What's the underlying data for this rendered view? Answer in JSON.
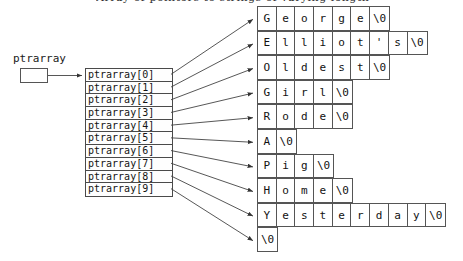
{
  "caption": {
    "text": "Array of pointers to strings of varying length"
  },
  "pointer_variable": {
    "label": "ptrarray",
    "box_value": ""
  },
  "array": {
    "name": "ptrarray",
    "cells": [
      {
        "label": "ptrarray[0]"
      },
      {
        "label": "ptrarray[1]"
      },
      {
        "label": "ptrarray[2]"
      },
      {
        "label": "ptrarray[3]"
      },
      {
        "label": "ptrarray[4]"
      },
      {
        "label": "ptrarray[5]"
      },
      {
        "label": "ptrarray[6]"
      },
      {
        "label": "ptrarray[7]"
      },
      {
        "label": "ptrarray[8]"
      },
      {
        "label": "ptrarray[9]"
      }
    ]
  },
  "strings": [
    {
      "index": 0,
      "text": "George",
      "chars": [
        "G",
        "e",
        "o",
        "r",
        "g",
        "e",
        "\\0"
      ]
    },
    {
      "index": 1,
      "text": "Elliot's",
      "chars": [
        "E",
        "l",
        "l",
        "i",
        "o",
        "t",
        "'",
        "s",
        "\\0"
      ]
    },
    {
      "index": 2,
      "text": "Oldest",
      "chars": [
        "O",
        "l",
        "d",
        "e",
        "s",
        "t",
        "\\0"
      ]
    },
    {
      "index": 3,
      "text": "Girl",
      "chars": [
        "G",
        "i",
        "r",
        "l",
        "\\0"
      ]
    },
    {
      "index": 4,
      "text": "Rode",
      "chars": [
        "R",
        "o",
        "d",
        "e",
        "\\0"
      ]
    },
    {
      "index": 5,
      "text": "A",
      "chars": [
        "A",
        "\\0"
      ]
    },
    {
      "index": 6,
      "text": "Pig",
      "chars": [
        "P",
        "i",
        "g",
        "\\0"
      ]
    },
    {
      "index": 7,
      "text": "Home",
      "chars": [
        "H",
        "o",
        "m",
        "e",
        "\\0"
      ]
    },
    {
      "index": 8,
      "text": "Yesterday",
      "chars": [
        "Y",
        "e",
        "s",
        "t",
        "e",
        "r",
        "d",
        "a",
        "y",
        "\\0"
      ]
    },
    {
      "index": 9,
      "text": "",
      "chars": [
        "\\0"
      ]
    }
  ],
  "colors": {
    "line": "#4a4a4a",
    "text": "#141414",
    "background": "#ffffff"
  }
}
